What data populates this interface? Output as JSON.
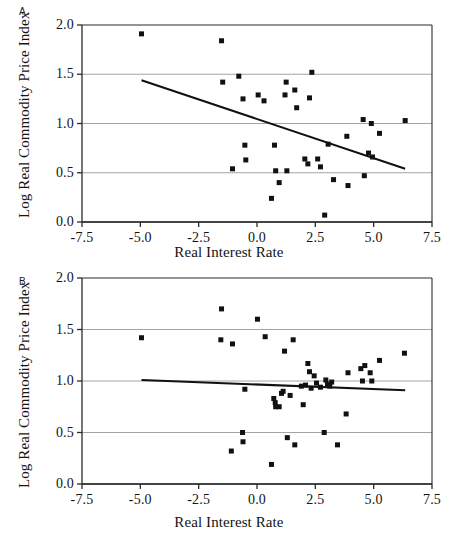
{
  "figure": {
    "panel_a_letter": "A",
    "panel_b_letter": "B",
    "marker_color": "#111111",
    "trendline_color": "#111111",
    "gridline_color": "#9a9a9a",
    "axis_color": "#2b2b2b",
    "background": "#ffffff"
  },
  "chart_data": [
    {
      "panel": "A",
      "type": "scatter",
      "title": "A",
      "xlabel": "Real Interest Rate",
      "ylabel": "Log Real Commodity Price Index",
      "xlim": [
        -7.5,
        7.5
      ],
      "ylim": [
        0.0,
        2.0
      ],
      "xticks": [
        -7.5,
        -5.0,
        -2.5,
        0.0,
        2.5,
        5.0,
        7.5
      ],
      "xtick_labels": [
        "-7.5",
        "-5.0",
        "-2.5",
        "0.0",
        "2.5",
        "5.0",
        "7.5"
      ],
      "yticks": [
        0.0,
        0.5,
        1.0,
        1.5,
        2.0
      ],
      "ytick_labels": [
        "0.0",
        "0.5",
        "1.0",
        "1.5",
        "2.0"
      ],
      "grid": true,
      "legend": null,
      "marker": "square",
      "points": [
        [
          -4.95,
          1.91
        ],
        [
          -1.52,
          1.84
        ],
        [
          -1.47,
          1.42
        ],
        [
          -0.78,
          1.48
        ],
        [
          -0.6,
          1.25
        ],
        [
          -0.52,
          0.78
        ],
        [
          -0.48,
          0.63
        ],
        [
          -1.05,
          0.54
        ],
        [
          0.05,
          1.29
        ],
        [
          0.3,
          1.23
        ],
        [
          0.62,
          0.24
        ],
        [
          0.75,
          0.78
        ],
        [
          0.8,
          0.52
        ],
        [
          0.95,
          0.4
        ],
        [
          1.2,
          1.29
        ],
        [
          1.25,
          1.42
        ],
        [
          1.28,
          0.52
        ],
        [
          1.62,
          1.34
        ],
        [
          1.7,
          1.16
        ],
        [
          2.05,
          0.64
        ],
        [
          2.18,
          0.59
        ],
        [
          2.25,
          1.26
        ],
        [
          2.35,
          1.52
        ],
        [
          2.6,
          0.64
        ],
        [
          2.72,
          0.56
        ],
        [
          2.9,
          0.07
        ],
        [
          3.05,
          0.79
        ],
        [
          3.28,
          0.43
        ],
        [
          3.85,
          0.87
        ],
        [
          3.9,
          0.37
        ],
        [
          4.55,
          1.04
        ],
        [
          4.6,
          0.47
        ],
        [
          4.78,
          0.7
        ],
        [
          4.9,
          1.0
        ],
        [
          4.95,
          0.66
        ],
        [
          5.25,
          0.9
        ],
        [
          6.35,
          1.03
        ]
      ],
      "trendline": {
        "x0": -4.95,
        "y0": 1.44,
        "x1": 6.35,
        "y1": 0.54
      }
    },
    {
      "panel": "B",
      "type": "scatter",
      "title": "B",
      "xlabel": "Real Interest Rate",
      "ylabel": "Log Real Commodity Price Index",
      "xlim": [
        -7.5,
        7.5
      ],
      "ylim": [
        0.0,
        2.0
      ],
      "xticks": [
        -7.5,
        -5.0,
        -2.5,
        0.0,
        2.5,
        5.0,
        7.5
      ],
      "xtick_labels": [
        "-7.5",
        "-5.0",
        "-2.5",
        "0.0",
        "2.5",
        "5.0",
        "7.5"
      ],
      "yticks": [
        0.0,
        0.5,
        1.0,
        1.5,
        2.0
      ],
      "ytick_labels": [
        "0.0",
        "0.5",
        "1.0",
        "1.5",
        "2.0"
      ],
      "grid": true,
      "legend": null,
      "marker": "square",
      "points": [
        [
          -4.95,
          1.42
        ],
        [
          -1.52,
          1.7
        ],
        [
          -1.55,
          1.4
        ],
        [
          -1.05,
          1.36
        ],
        [
          -1.1,
          0.32
        ],
        [
          -0.62,
          0.5
        ],
        [
          -0.6,
          0.41
        ],
        [
          -0.52,
          0.92
        ],
        [
          0.02,
          1.6
        ],
        [
          0.35,
          1.43
        ],
        [
          0.62,
          0.19
        ],
        [
          0.72,
          0.83
        ],
        [
          0.78,
          0.79
        ],
        [
          0.8,
          0.75
        ],
        [
          0.95,
          0.75
        ],
        [
          1.05,
          0.88
        ],
        [
          1.12,
          0.9
        ],
        [
          1.18,
          1.29
        ],
        [
          1.3,
          0.45
        ],
        [
          1.42,
          0.86
        ],
        [
          1.55,
          1.4
        ],
        [
          1.62,
          0.38
        ],
        [
          1.9,
          0.95
        ],
        [
          1.98,
          0.77
        ],
        [
          2.08,
          0.96
        ],
        [
          2.18,
          1.17
        ],
        [
          2.25,
          1.09
        ],
        [
          2.32,
          0.93
        ],
        [
          2.45,
          1.05
        ],
        [
          2.55,
          0.98
        ],
        [
          2.72,
          0.94
        ],
        [
          2.88,
          0.5
        ],
        [
          2.95,
          1.01
        ],
        [
          3.02,
          0.97
        ],
        [
          3.12,
          0.95
        ],
        [
          3.2,
          0.99
        ],
        [
          3.45,
          0.38
        ],
        [
          3.82,
          0.68
        ],
        [
          3.9,
          1.08
        ],
        [
          4.45,
          1.12
        ],
        [
          4.52,
          1.0
        ],
        [
          4.62,
          1.15
        ],
        [
          4.85,
          1.08
        ],
        [
          4.92,
          1.0
        ],
        [
          5.25,
          1.2
        ],
        [
          6.32,
          1.27
        ]
      ],
      "trendline": {
        "x0": -4.95,
        "y0": 1.01,
        "x1": 6.35,
        "y1": 0.91
      }
    }
  ]
}
